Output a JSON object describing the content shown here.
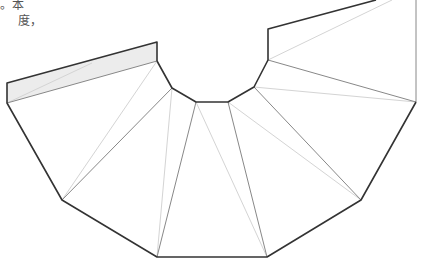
{
  "text": {
    "line1": "。本",
    "line2": "度，"
  },
  "colors": {
    "outline": "#333333",
    "fold": "#888888",
    "light": "#d4d4d4",
    "strip_fill": "#ececec"
  },
  "diagram": {
    "type": "net-of-truncated-cone",
    "outer_arc": [
      [
        7,
        103
      ],
      [
        62,
        200
      ],
      [
        157,
        257
      ],
      [
        267,
        257
      ],
      [
        361,
        200
      ],
      [
        416,
        102
      ]
    ],
    "inner_arc": [
      [
        157,
        61
      ],
      [
        172,
        88
      ],
      [
        196,
        102
      ],
      [
        228,
        102
      ],
      [
        254,
        87
      ],
      [
        268,
        60
      ]
    ]
  }
}
